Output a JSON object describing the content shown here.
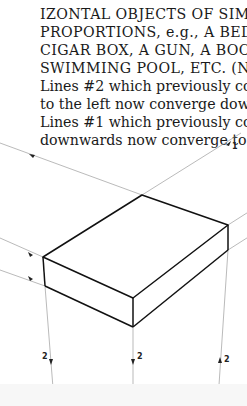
{
  "document": {
    "text_lines": [
      "IZONTAL OBJECTS OF SIMILAR",
      "PROPORTIONS, e.g., A BED, A",
      "CIGAR BOX, A GUN, A BOOK, A",
      "SWIMMING POOL, ETC. (Note",
      "Lines #2 which previously converged",
      "to the left now converge downwards.",
      "Lines #1 which previously converged",
      "downwards now converge to right.)"
    ]
  },
  "figure": {
    "labels": {
      "line1": "1",
      "line2_left": "2",
      "line2_middle": "2",
      "line2_right": "2"
    },
    "colors": {
      "edge": "#111111",
      "construction": "#8a8a8a",
      "text": "#1a1a1a"
    }
  }
}
